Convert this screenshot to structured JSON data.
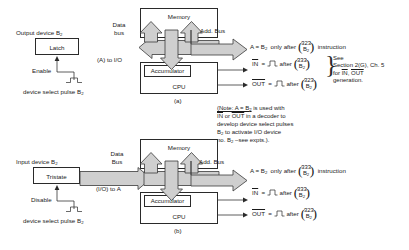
{
  "figure": {
    "panel_a": {
      "tag": "(a)",
      "device_label": "Output device B",
      "device_sub": "2",
      "device_box": "Latch",
      "control_label": "Enable",
      "pulse_caption": "device select pulse B",
      "pulse_caption_sub": "2",
      "bus_label_line1": "Data",
      "bus_label_line2": "bus",
      "bus_flow_label": "(A) to I/O",
      "addr_bus_label": "Add. Bus",
      "memory": "Memory",
      "accumulator": "Accumulator",
      "cpu": "CPU",
      "equations": [
        {
          "lhs": "A = B",
          "lhs_sub": "2",
          "mid": "only after",
          "code_top": "323",
          "code_bot": "B",
          "code_bot_sub": "2",
          "tail": "instruction",
          "overline": false,
          "pulse": false
        },
        {
          "lhs": "IN",
          "mid": "after",
          "code_top": "333",
          "code_bot": "B",
          "code_bot_sub": "2",
          "tail": "",
          "overline": true,
          "pulse": true
        },
        {
          "lhs": "OUT",
          "mid": "after",
          "code_top": "323",
          "code_bot": "B",
          "code_bot_sub": "2",
          "tail": "",
          "overline": true,
          "pulse": true
        }
      ],
      "side_note": [
        "See",
        "Section 2(G), Ch. 5",
        "for IN, OUT",
        "generation."
      ]
    },
    "panel_b": {
      "tag": "(b)",
      "device_label": "Input device B",
      "device_sub": "2",
      "device_box": "Tristate",
      "control_label": "Disable",
      "pulse_caption": "device select pulse B",
      "pulse_caption_sub": "2",
      "bus_label_line1": "Data",
      "bus_label_line2": "Bus",
      "bus_flow_label": "(I/O) to A",
      "addr_bus_label": "Add. Bus",
      "memory": "Memory",
      "accumulator": "Accumulator",
      "cpu": "CPU",
      "equations": [
        {
          "lhs": "A = B",
          "lhs_sub": "2",
          "mid": "only after",
          "code_top": "333",
          "code_bot": "B",
          "code_bot_sub": "2",
          "tail": "instruction",
          "overline": false,
          "pulse": false
        },
        {
          "lhs": "IN",
          "mid": "after",
          "code_top": "333",
          "code_bot": "B",
          "code_bot_sub": "2",
          "tail": "",
          "overline": true,
          "pulse": true
        },
        {
          "lhs": "OUT",
          "mid": "after",
          "code_top": "323",
          "code_bot": "B",
          "code_bot_sub": "2",
          "tail": "",
          "overline": true,
          "pulse": true
        }
      ]
    },
    "center_note": {
      "line1_a": "(Note: A = B",
      "line1_a_sub": "2",
      "line1_b": " is used with",
      "line2_a": "IN",
      "line2_b": " or ",
      "line2_c": "OUT",
      "line2_d": " in a decoder to",
      "line3": "develop device select pulses",
      "line4_a": "B",
      "line4_a_sub": "2",
      "line4_b": " to activate I/O device",
      "line5_a": "no. B",
      "line5_a_sub": "2",
      "line5_b": " –see expts.)."
    },
    "colors": {
      "bus_fill": "#cfcfcf",
      "line": "#2a2a2a",
      "background": "#ffffff"
    }
  }
}
